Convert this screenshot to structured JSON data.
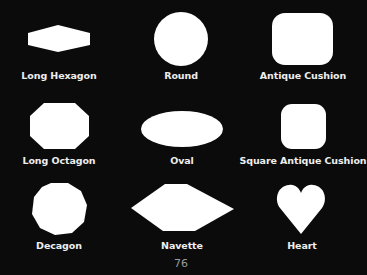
{
  "page": {
    "background_color": "#0b0b0b",
    "shape_color": "#ffffff",
    "label_color": "#eeeeee",
    "page_number": "76"
  },
  "shapes": [
    {
      "label": "Long Hexagon",
      "icon": "long-hexagon-shape"
    },
    {
      "label": "Round",
      "icon": "round-shape"
    },
    {
      "label": "Antique Cushion",
      "icon": "antique-cushion-shape"
    },
    {
      "label": "Long Octagon",
      "icon": "long-octagon-shape"
    },
    {
      "label": "Oval",
      "icon": "oval-shape"
    },
    {
      "label": "Square Antique Cushion",
      "icon": "square-antique-cushion-shape"
    },
    {
      "label": "Decagon",
      "icon": "decagon-shape"
    },
    {
      "label": "Navette",
      "icon": "navette-shape"
    },
    {
      "label": "Heart",
      "icon": "heart-shape"
    }
  ]
}
